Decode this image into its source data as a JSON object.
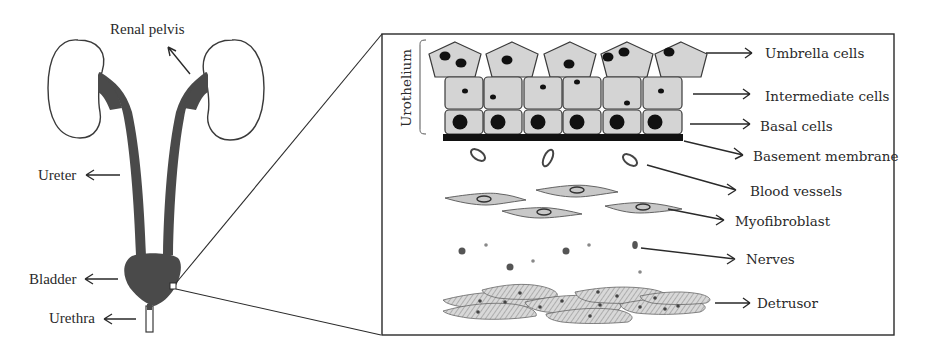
{
  "figure": {
    "left_panel": {
      "labels": {
        "renal_pelvis": "Renal pelvis",
        "ureter": "Ureter",
        "bladder": "Bladder",
        "urethra": "Urethra"
      }
    },
    "right_panel": {
      "bracket_label": "Urothelium",
      "labels": {
        "umbrella_cells": "Umbrella cells",
        "intermediate_cells": "Intermediate cells",
        "basal_cells": "Basal cells",
        "basement_membrane": "Basement membrane",
        "blood_vessels": "Blood vessels",
        "myofibroblast": "Myofibroblast",
        "nerves": "Nerves",
        "detrusor": "Detrusor"
      },
      "layers": [
        {
          "name": "Umbrella cells",
          "count": 5,
          "shape": "pentagon"
        },
        {
          "name": "Intermediate cells",
          "count": 6,
          "shape": "rounded-rectangle"
        },
        {
          "name": "Basal cells",
          "count": 6,
          "shape": "rounded-rectangle"
        }
      ]
    },
    "colors": {
      "ink": "#2a2a2a",
      "organ_fill": "#4a4a4a",
      "cell_fill": "#d4d4d4",
      "nucleus": "#111111"
    }
  }
}
